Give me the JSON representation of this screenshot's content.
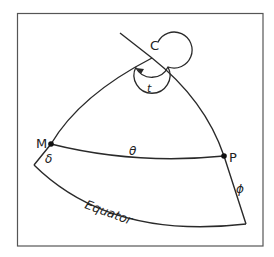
{
  "figure": {
    "labels": {
      "pole": "C",
      "angle_t": "t",
      "point_m": "M",
      "point_p": "P",
      "arc_theta": "θ",
      "arc_delta": "δ",
      "arc_phi": "ϕ",
      "equator": "Equator"
    },
    "colors": {
      "line": "#2a2a2a",
      "frame": "#555555",
      "background": "#ffffff"
    }
  }
}
